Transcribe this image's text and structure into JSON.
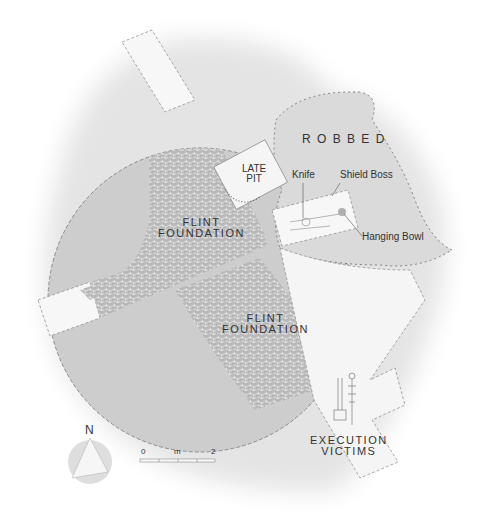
{
  "labels": {
    "robbed": "R O B B E D",
    "late_pit_line1": "LATE",
    "late_pit_line2": "PIT",
    "knife": "Knife",
    "shield_boss": "Shield Boss",
    "hanging_bowl": "Hanging Bowl",
    "flint_upper_line1": "FLINT",
    "flint_upper_line2": "FOUNDATION",
    "flint_lower_line1": "FLINT",
    "flint_lower_line2": "FOUNDATION",
    "execution_line1": "EXECUTION",
    "execution_line2": "VICTIMS"
  },
  "north_arrow": {
    "label": "N",
    "icon": "north-arrow-icon"
  },
  "scale_bar": {
    "start": "0",
    "unit": "m",
    "end": "2",
    "segments": 4
  },
  "colors": {
    "background": "#ffffff",
    "halo": "#e6e6e6",
    "circle": "#cfcfcf",
    "flint": "#bdbdbd",
    "trench": "#f6f6f6",
    "text": "#333333",
    "line": "#666666"
  }
}
